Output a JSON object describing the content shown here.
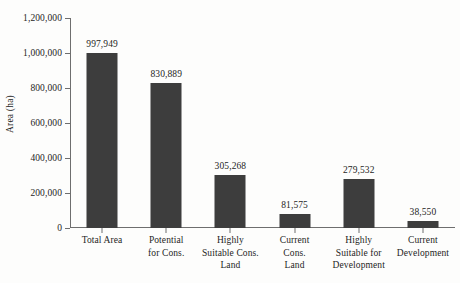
{
  "chart_data": {
    "type": "bar",
    "title": "",
    "xlabel": "",
    "ylabel": "Area (ha)",
    "ylim": [
      0,
      1200000
    ],
    "ytick_labels": [
      "0",
      "200,000",
      "400,000",
      "600,000",
      "800,000",
      "1,000,000",
      "1,200,000"
    ],
    "ytick_values": [
      0,
      200000,
      400000,
      600000,
      800000,
      1000000,
      1200000
    ],
    "grid": false,
    "legend": "none",
    "categories": [
      "Total Area",
      "Potential for Cons.",
      "Highly Suitable Cons. Land",
      "Current Cons. Land",
      "Highly Suitable for Development",
      "Current Development"
    ],
    "category_lines": [
      [
        "Total Area"
      ],
      [
        "Potential",
        "for Cons."
      ],
      [
        "Highly",
        "Suitable Cons.",
        "Land"
      ],
      [
        "Current",
        "Cons.",
        "Land"
      ],
      [
        "Highly",
        "Suitable for",
        "Development"
      ],
      [
        "Current",
        "Development"
      ]
    ],
    "values": [
      997949,
      830889,
      305268,
      81575,
      279532,
      38550
    ],
    "value_labels": [
      "997,949",
      "830,889",
      "305,268",
      "81,575",
      "279,532",
      "38,550"
    ],
    "bar_color": "#3d3d3d",
    "axis_color": "#6e6e6e",
    "background_color": "#fdfdfc"
  }
}
